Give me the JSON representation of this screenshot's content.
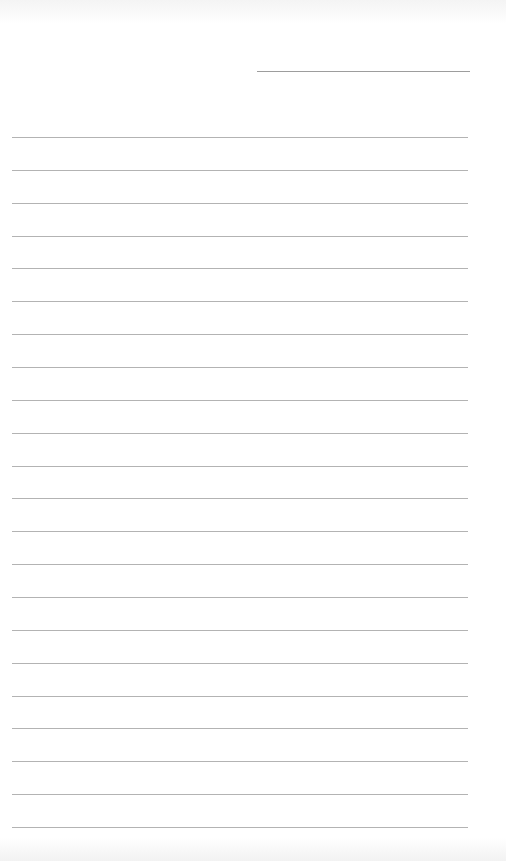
{
  "page": {
    "type": "lined-paper",
    "background": "#ffffff",
    "line_color": "#9a9a9a"
  },
  "header_line": {
    "x1": 257,
    "x2": 470,
    "y": 71
  },
  "ruled_lines": {
    "count": 22,
    "x1": 12,
    "x2": 468,
    "first_y": 137,
    "spacing": 32.86
  }
}
